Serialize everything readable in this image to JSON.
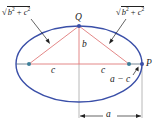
{
  "diagram": {
    "type": "ellipse-geometry",
    "colors": {
      "ellipse": "#3a4fa8",
      "triangle": "#e07a7a",
      "axis": "#e07a7a",
      "points": "#3d7f9a",
      "guides": "#b8b8b8",
      "text": "#222222"
    },
    "labels": {
      "left_hyp": {
        "radical": "√",
        "base1": "b",
        "exp1": "2",
        "op": " + ",
        "base2": "c",
        "exp2": "2"
      },
      "right_hyp": {
        "radical": "√",
        "base1": "b",
        "exp1": "2",
        "op": " + ",
        "base2": "c",
        "exp2": "2"
      },
      "point_q": "Q",
      "point_p": "P",
      "semi_minor": "b",
      "left_c": "c",
      "right_c": "c",
      "a_minus_c": "a − c",
      "semi_major": "a"
    },
    "geometry": {
      "center": [
        79,
        64
      ],
      "semi_major_px": 63,
      "semi_minor_px": 38,
      "foci": [
        [
          29,
          64
        ],
        [
          129,
          64
        ]
      ],
      "q": [
        79,
        26
      ],
      "p": [
        142,
        64
      ]
    }
  }
}
